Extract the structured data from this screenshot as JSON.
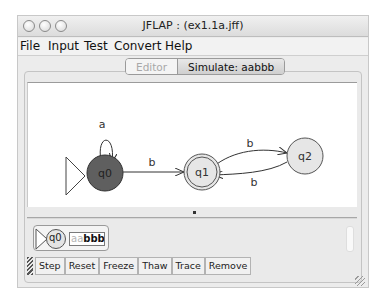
{
  "window": {
    "title": "JFLAP : (ex1.1a.jff)",
    "buttons": [
      "close",
      "minimize",
      "zoom"
    ]
  },
  "menubar": {
    "items": [
      {
        "label": "File"
      },
      {
        "label": "Input"
      },
      {
        "label": "Test"
      },
      {
        "label": "Convert"
      },
      {
        "label": "Help"
      }
    ]
  },
  "tabs": [
    {
      "label": "Editor",
      "active": false
    },
    {
      "label": "Simulate: aabbb",
      "active": true
    }
  ],
  "automaton": {
    "states": [
      {
        "id": "q0",
        "label": "q0",
        "initial": true,
        "final": false,
        "current": true,
        "color": "#5f5f5f"
      },
      {
        "id": "q1",
        "label": "q1",
        "initial": false,
        "final": true,
        "current": false,
        "color": "#e0e0e0"
      },
      {
        "id": "q2",
        "label": "q2",
        "initial": false,
        "final": false,
        "current": false,
        "color": "#e0e0e0"
      }
    ],
    "transitions": [
      {
        "from": "q0",
        "to": "q0",
        "label": "a"
      },
      {
        "from": "q0",
        "to": "q1",
        "label": "b"
      },
      {
        "from": "q1",
        "to": "q2",
        "label": "b"
      },
      {
        "from": "q2",
        "to": "q1",
        "label": "b"
      }
    ]
  },
  "configuration": {
    "state": "q0",
    "tape_consumed": "aa",
    "tape_remaining": "bbb"
  },
  "toolbar": {
    "step": "Step",
    "reset": "Reset",
    "freeze": "Freeze",
    "thaw": "Thaw",
    "trace": "Trace",
    "remove": "Remove"
  }
}
